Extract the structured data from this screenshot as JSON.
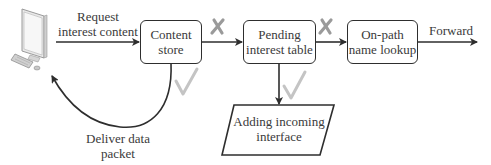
{
  "diagram": {
    "nodes": {
      "user": {
        "icon": "desktop-computer-icon"
      },
      "content_store": {
        "line1": "Content",
        "line2": "store"
      },
      "pit": {
        "line1": "Pending",
        "line2": "interest table"
      },
      "lookup": {
        "line1": "On-path",
        "line2": "name lookup"
      },
      "adding": {
        "line1": "Adding incoming",
        "line2": "interface"
      }
    },
    "edges": {
      "request": {
        "line1": "Request",
        "line2": "interest content"
      },
      "deliver": {
        "line1": "Deliver data",
        "line2": "packet"
      },
      "forward": {
        "label": "Forward"
      }
    },
    "marks": {
      "miss_symbol": "✗",
      "hit_symbol": "✓"
    },
    "colors": {
      "line": "#2e2e2e",
      "mark": "#9a9a9a"
    }
  }
}
